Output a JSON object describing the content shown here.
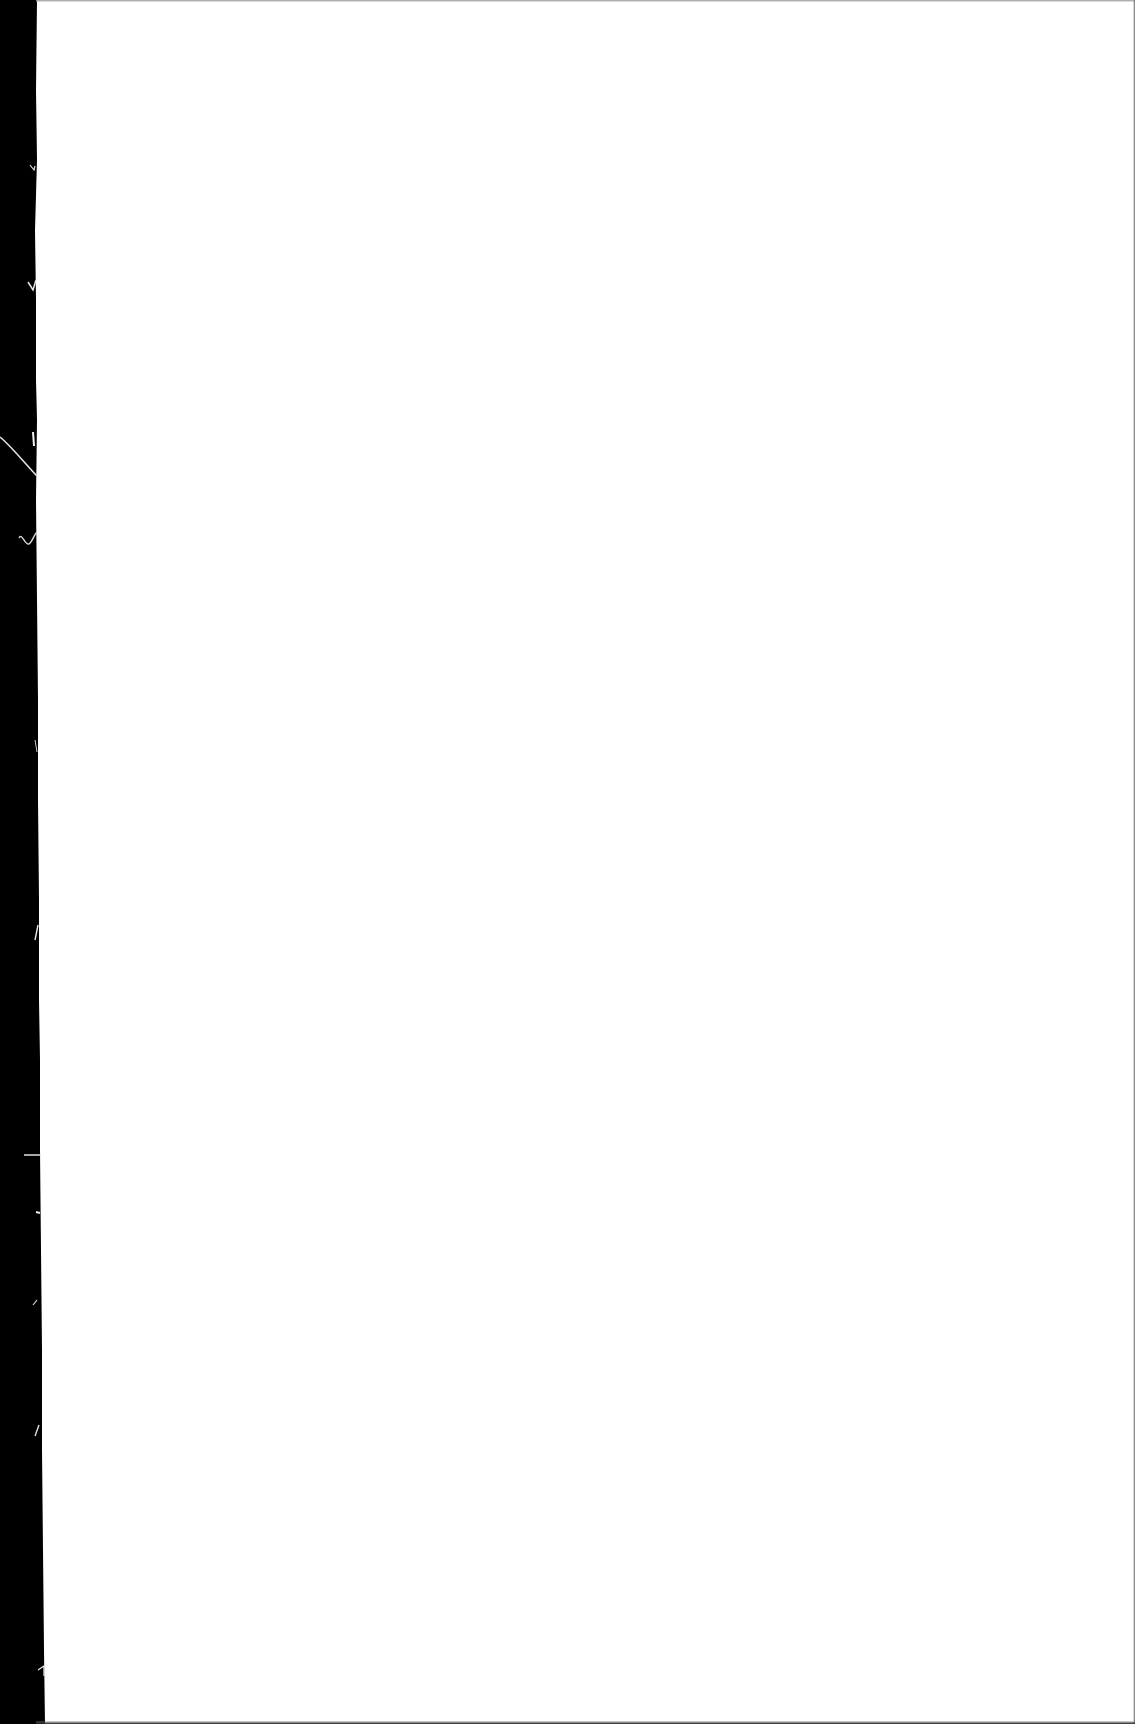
{
  "document": {
    "type": "scanned-page",
    "page_text": "",
    "is_blank": true
  },
  "scan": {
    "background_color": "#ffffff",
    "border_color": "#000000",
    "left_border_width_top_px": 36,
    "left_border_width_bottom_px": 45,
    "top_edge_color": "#9a9a9a",
    "bottom_edge_color": "#222222",
    "right_edge_color": "#6a6a6a"
  }
}
